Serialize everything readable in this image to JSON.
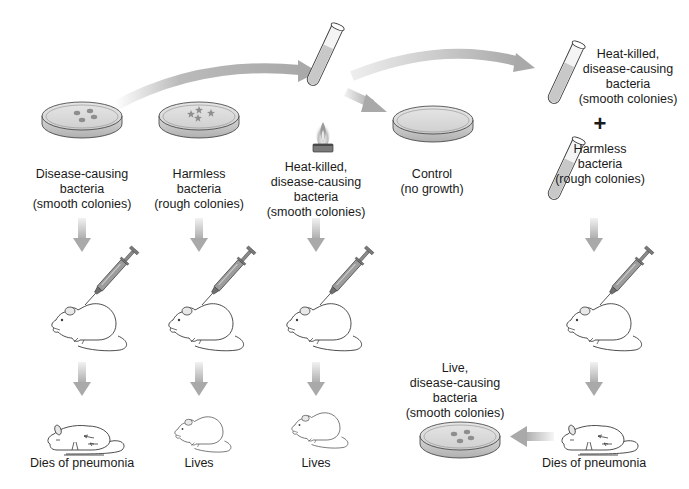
{
  "diagram": {
    "type": "griffith-transformation-experiment",
    "colors": {
      "arrow": "#a9a9a9",
      "dish_fill": "#d4d4d4",
      "dish_rim": "#bcbcbc",
      "colony": "#8e8e8e",
      "tube_fluid": "#c8c8c8",
      "outline": "#3a3a3a",
      "flame": "#9a9a9a"
    },
    "columns": [
      {
        "id": "disease-causing",
        "source_label": [
          "Disease-causing",
          "bacteria",
          "(smooth colonies)"
        ],
        "icon": "petri-dish-smooth-colonies",
        "injection": "syringe-icon",
        "outcome": "Dies of pneumonia",
        "outcome_icon": "dead-mouse-icon"
      },
      {
        "id": "harmless",
        "source_label": [
          "Harmless",
          "bacteria",
          "(rough colonies)"
        ],
        "icon": "petri-dish-rough-colonies",
        "injection": "syringe-icon",
        "outcome": "Lives",
        "outcome_icon": "live-mouse-icon"
      },
      {
        "id": "heat-killed",
        "source_label": [
          "Heat-killed,",
          "disease-causing",
          "bacteria",
          "(smooth colonies)"
        ],
        "icon": "test-tube-over-burner",
        "injection": "syringe-icon",
        "outcome": "Lives",
        "outcome_icon": "live-mouse-icon"
      },
      {
        "id": "control",
        "source_label": [
          "Control",
          "(no growth)"
        ],
        "icon": "empty-petri-dish"
      },
      {
        "id": "mixture",
        "tube1_label": [
          "Heat-killed,",
          "disease-causing",
          "bacteria",
          "(smooth colonies)"
        ],
        "plus": "+",
        "tube2_label": [
          "Harmless",
          "bacteria",
          "(rough colonies)"
        ],
        "injection": "syringe-icon",
        "outcome": "Dies of pneumonia",
        "outcome_icon": "dead-mouse-icon",
        "result_label": [
          "Live,",
          "disease-causing",
          "bacteria",
          "(smooth colonies)"
        ],
        "result_icon": "petri-dish-smooth-colonies"
      }
    ]
  }
}
